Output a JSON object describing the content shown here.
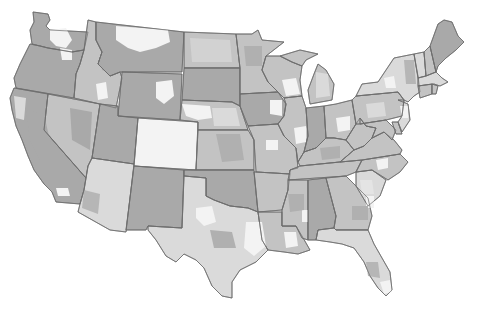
{
  "map": {
    "title": "",
    "description": "Grayscale choropleth map of the contiguous United States with state boundaries and sub-state regions shaded in four tones",
    "legend": null,
    "palette": {
      "background": "#ffffff",
      "border": "#6b6b6b",
      "dark": "#a9a9a9",
      "mid": "#c3c3c3",
      "light": "#dadada",
      "lightest": "#f3f3f3"
    },
    "states": [
      {
        "id": "WA",
        "base": "dark"
      },
      {
        "id": "OR",
        "base": "dark"
      },
      {
        "id": "CA",
        "base": "dark"
      },
      {
        "id": "ID",
        "base": "mid"
      },
      {
        "id": "NV",
        "base": "mid"
      },
      {
        "id": "MT",
        "base": "dark"
      },
      {
        "id": "WY",
        "base": "dark"
      },
      {
        "id": "UT",
        "base": "dark"
      },
      {
        "id": "AZ",
        "base": "light"
      },
      {
        "id": "CO",
        "base": "lightest"
      },
      {
        "id": "NM",
        "base": "dark"
      },
      {
        "id": "ND",
        "base": "mid"
      },
      {
        "id": "SD",
        "base": "dark"
      },
      {
        "id": "NE",
        "base": "mid"
      },
      {
        "id": "KS",
        "base": "mid"
      },
      {
        "id": "OK",
        "base": "dark"
      },
      {
        "id": "TX",
        "base": "light"
      },
      {
        "id": "MN",
        "base": "mid"
      },
      {
        "id": "IA",
        "base": "dark"
      },
      {
        "id": "MO",
        "base": "mid"
      },
      {
        "id": "AR",
        "base": "mid"
      },
      {
        "id": "LA",
        "base": "mid"
      },
      {
        "id": "WI",
        "base": "mid"
      },
      {
        "id": "IL",
        "base": "mid"
      },
      {
        "id": "MI",
        "base": "mid"
      },
      {
        "id": "IN",
        "base": "dark"
      },
      {
        "id": "OH",
        "base": "mid"
      },
      {
        "id": "KY",
        "base": "mid"
      },
      {
        "id": "TN",
        "base": "mid"
      },
      {
        "id": "MS",
        "base": "mid"
      },
      {
        "id": "AL",
        "base": "dark"
      },
      {
        "id": "GA",
        "base": "mid"
      },
      {
        "id": "FL",
        "base": "light"
      },
      {
        "id": "SC",
        "base": "light"
      },
      {
        "id": "NC",
        "base": "mid"
      },
      {
        "id": "VA",
        "base": "mid"
      },
      {
        "id": "WV",
        "base": "mid"
      },
      {
        "id": "PA",
        "base": "mid"
      },
      {
        "id": "NY",
        "base": "light"
      },
      {
        "id": "VT",
        "base": "light"
      },
      {
        "id": "NH",
        "base": "mid"
      },
      {
        "id": "ME",
        "base": "dark"
      },
      {
        "id": "MA",
        "base": "light"
      },
      {
        "id": "CT",
        "base": "mid"
      },
      {
        "id": "RI",
        "base": "mid"
      },
      {
        "id": "NJ",
        "base": "light"
      },
      {
        "id": "DE",
        "base": "mid"
      },
      {
        "id": "MD",
        "base": "mid"
      }
    ]
  }
}
